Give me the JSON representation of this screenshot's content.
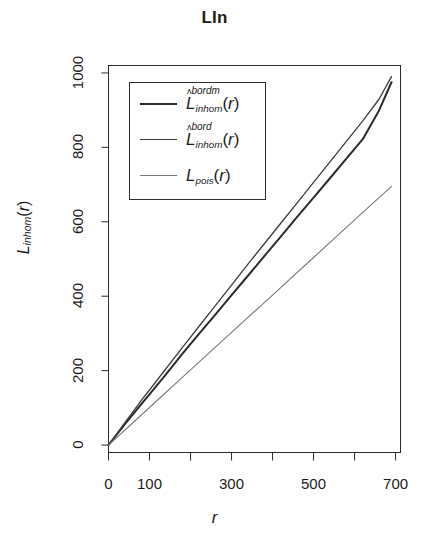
{
  "chart_data": {
    "type": "line",
    "title": "LIn",
    "xlabel": "r",
    "ylabel": "L_inhom(r)",
    "xlim": [
      0,
      712
    ],
    "ylim": [
      -20,
      1020
    ],
    "grid": false,
    "legend_position": "top-left",
    "xticks": [
      0,
      100,
      200,
      300,
      400,
      500,
      600,
      700
    ],
    "xtick_labels": [
      "0",
      "100",
      "",
      "300",
      "",
      "500",
      "",
      "700"
    ],
    "yticks": [
      0,
      200,
      400,
      600,
      800,
      1000
    ],
    "ytick_labels": [
      "0",
      "200",
      "400",
      "600",
      "800",
      "1000"
    ],
    "series": [
      {
        "name": "L^bordm_inhom(r)",
        "label_base": "L",
        "label_sup": "bordm",
        "label_sub": "inhom",
        "label_arg": "(r)",
        "color": "#2b2b2b",
        "width": 2.0,
        "x": [
          0,
          20,
          40,
          60,
          80,
          100,
          140,
          180,
          220,
          260,
          300,
          340,
          380,
          420,
          460,
          500,
          540,
          580,
          620,
          660,
          690
        ],
        "y": [
          0,
          28,
          56,
          83,
          110,
          136,
          190,
          245,
          298,
          350,
          403,
          455,
          508,
          560,
          613,
          665,
          717,
          770,
          822,
          900,
          975
        ]
      },
      {
        "name": "L^bord_inhom(r)",
        "label_base": "L",
        "label_sup": "bord",
        "label_sub": "inhom",
        "label_arg": "(r)",
        "color": "#3d3d3d",
        "width": 1.3,
        "x": [
          0,
          20,
          40,
          60,
          80,
          100,
          140,
          180,
          220,
          260,
          300,
          340,
          380,
          420,
          460,
          500,
          540,
          580,
          620,
          660,
          690
        ],
        "y": [
          0,
          30,
          60,
          90,
          120,
          148,
          205,
          262,
          318,
          374,
          430,
          486,
          541,
          596,
          651,
          706,
          761,
          816,
          871,
          930,
          990
        ]
      },
      {
        "name": "L_pois(r)",
        "label_base": "L",
        "label_sup": "",
        "label_sub": "pois",
        "label_arg": "(r)",
        "color": "#7a7a7a",
        "width": 1.1,
        "x": [
          0,
          100,
          200,
          300,
          400,
          500,
          600,
          690
        ],
        "y": [
          0,
          101,
          202,
          303,
          403,
          504,
          605,
          695
        ]
      }
    ]
  },
  "legend": {
    "items": [
      {
        "base": "L",
        "sup": "bordm",
        "sub": "inhom",
        "arg": "(r)",
        "hat": "ʌ"
      },
      {
        "base": "L",
        "sup": "bord",
        "sub": "inhom",
        "arg": "(r)",
        "hat": "ʌ"
      },
      {
        "base": "L",
        "sup": "",
        "sub": "pois",
        "arg": "(r)",
        "hat": ""
      }
    ]
  },
  "axis": {
    "x_title": "r",
    "y_title_base": "L",
    "y_title_sub": "inhom",
    "y_title_arg": "(r)"
  }
}
